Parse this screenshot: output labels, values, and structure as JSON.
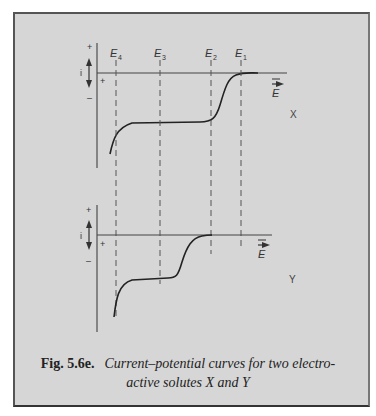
{
  "figure": {
    "number_label": "Fig. 5.6e.",
    "caption_line1": "Current–potential curves for two electro-",
    "caption_line2": "active solutes X and Y"
  },
  "axes": {
    "current_label": "i",
    "plus_sign": "+",
    "minus_sign": "–",
    "potential_label": "E"
  },
  "potentials": [
    {
      "label": "E",
      "sub": "4",
      "x": 116
    },
    {
      "label": "E",
      "sub": "3",
      "x": 160
    },
    {
      "label": "E",
      "sub": "2",
      "x": 211
    },
    {
      "label": "E",
      "sub": "1",
      "x": 241
    }
  ],
  "plots": [
    {
      "name": "X",
      "label": "X",
      "waves_between": [
        "E4",
        "E1-E2"
      ],
      "description": "two-step reduction wave; half-wave near midpoint of E2-E1 and near E4"
    },
    {
      "name": "Y",
      "label": "Y",
      "waves_between": [
        "E4",
        "E3-E2"
      ],
      "description": "two-step reduction wave; half-wave near midpoint of E3-E2 and near E4"
    }
  ],
  "colors": {
    "background": "#d6d6d6",
    "ink": "#333333",
    "border": "#444444"
  }
}
